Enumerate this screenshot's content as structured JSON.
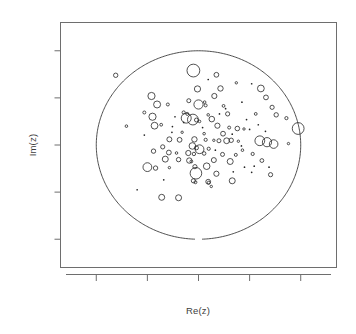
{
  "figure": {
    "width": 356,
    "height": 334,
    "background": "#ffffff",
    "line_color": "#6e6e6e",
    "point_color": "#262626",
    "circle_color": "#3a3a3a"
  },
  "labels": {
    "xlabel": "Re(z)",
    "ylabel": "Im(z)"
  },
  "chart_data": {
    "type": "scatter",
    "title": "",
    "xlabel": "Re(z)",
    "ylabel": "Im(z)",
    "grid": false,
    "legend": null,
    "xlim": [
      -1.35,
      1.35
    ],
    "ylim": [
      -1.3,
      1.3
    ],
    "x_ticks": [
      -1.0,
      -0.5,
      0.0,
      0.5,
      1.0
    ],
    "y_ticks": [
      -1.0,
      -0.5,
      0.0,
      0.5,
      1.0
    ],
    "x_tick_labels": [
      "",
      "",
      "",
      "",
      ""
    ],
    "y_tick_labels": [
      "",
      "",
      "",
      "",
      ""
    ],
    "annotations": [
      {
        "kind": "unit-circle",
        "center": [
          0.0,
          0.0
        ],
        "radius": 1.0,
        "note": "reference circle |z| = 1, drawn with a small gap at the bottom"
      }
    ],
    "size_encoding": "marker radius encodes magnitude/weight of each complex value",
    "point_count": 118,
    "points": [
      {
        "x": -0.81,
        "y": 0.74,
        "r": 2.2
      },
      {
        "x": -0.05,
        "y": 0.79,
        "r": 6.4
      },
      {
        "x": 0.175,
        "y": 0.745,
        "r": 2.4
      },
      {
        "x": 0.095,
        "y": 0.695,
        "r": 1.1
      },
      {
        "x": 0.37,
        "y": 0.66,
        "r": 1.2
      },
      {
        "x": 0.52,
        "y": 0.65,
        "r": 1.1
      },
      {
        "x": -0.01,
        "y": 0.595,
        "r": 3.1
      },
      {
        "x": 0.215,
        "y": 0.6,
        "r": 2.7
      },
      {
        "x": 0.61,
        "y": 0.6,
        "r": 3.4
      },
      {
        "x": -0.46,
        "y": 0.52,
        "r": 3.6
      },
      {
        "x": 0.155,
        "y": 0.52,
        "r": 2.6
      },
      {
        "x": 0.66,
        "y": 0.505,
        "r": 2.4
      },
      {
        "x": -0.095,
        "y": 0.47,
        "r": 2.0
      },
      {
        "x": 0.06,
        "y": 0.455,
        "r": 1.3
      },
      {
        "x": 0.425,
        "y": 0.455,
        "r": 1.1
      },
      {
        "x": -0.405,
        "y": 0.43,
        "r": 3.5
      },
      {
        "x": -0.3,
        "y": 0.43,
        "r": 1.5
      },
      {
        "x": 0.0,
        "y": 0.43,
        "r": 4.6
      },
      {
        "x": 0.07,
        "y": 0.42,
        "r": 1.5
      },
      {
        "x": 0.245,
        "y": 0.415,
        "r": 1.4
      },
      {
        "x": 0.72,
        "y": 0.4,
        "r": 2.1
      },
      {
        "x": -0.53,
        "y": 0.345,
        "r": 1.5
      },
      {
        "x": -0.145,
        "y": 0.345,
        "r": 1.6
      },
      {
        "x": -0.11,
        "y": 0.33,
        "r": 1.5
      },
      {
        "x": 0.095,
        "y": 0.32,
        "r": 1.3
      },
      {
        "x": 0.285,
        "y": 0.33,
        "r": 2.1
      },
      {
        "x": 0.56,
        "y": 0.33,
        "r": 1.4
      },
      {
        "x": 0.76,
        "y": 0.32,
        "r": 2.2
      },
      {
        "x": -0.45,
        "y": 0.3,
        "r": 3.6
      },
      {
        "x": -0.12,
        "y": 0.285,
        "r": 5.0
      },
      {
        "x": -0.055,
        "y": 0.27,
        "r": 5.4
      },
      {
        "x": -0.02,
        "y": 0.265,
        "r": 2.0
      },
      {
        "x": 0.01,
        "y": 0.25,
        "r": 1.3
      },
      {
        "x": 0.13,
        "y": 0.275,
        "r": 2.8
      },
      {
        "x": 0.86,
        "y": 0.285,
        "r": 1.6
      },
      {
        "x": -0.705,
        "y": 0.2,
        "r": 1.3
      },
      {
        "x": -0.43,
        "y": 0.205,
        "r": 3.4
      },
      {
        "x": -0.365,
        "y": 0.215,
        "r": 1.4
      },
      {
        "x": -0.255,
        "y": 0.195,
        "r": 1.1
      },
      {
        "x": 0.185,
        "y": 0.205,
        "r": 2.6
      },
      {
        "x": 0.3,
        "y": 0.185,
        "r": 1.5
      },
      {
        "x": 0.38,
        "y": 0.175,
        "r": 2.3
      },
      {
        "x": 0.445,
        "y": 0.17,
        "r": 1.2
      },
      {
        "x": 0.5,
        "y": 0.165,
        "r": 1.1
      },
      {
        "x": 0.975,
        "y": 0.175,
        "r": 5.9
      },
      {
        "x": -0.16,
        "y": 0.135,
        "r": 1.2
      },
      {
        "x": 0.055,
        "y": 0.12,
        "r": 1.3
      },
      {
        "x": 0.24,
        "y": 0.12,
        "r": 2.4
      },
      {
        "x": 0.33,
        "y": 0.115,
        "r": 1.1
      },
      {
        "x": -0.285,
        "y": 0.06,
        "r": 2.5
      },
      {
        "x": -0.185,
        "y": 0.055,
        "r": 2.4
      },
      {
        "x": -0.04,
        "y": 0.06,
        "r": 2.7
      },
      {
        "x": 0.07,
        "y": 0.055,
        "r": 1.6
      },
      {
        "x": 0.15,
        "y": 0.05,
        "r": 1.2
      },
      {
        "x": 0.2,
        "y": 0.045,
        "r": 2.0
      },
      {
        "x": 0.275,
        "y": 0.045,
        "r": 2.9
      },
      {
        "x": 0.32,
        "y": 0.05,
        "r": 2.2
      },
      {
        "x": 0.39,
        "y": 0.04,
        "r": 1.2
      },
      {
        "x": 0.6,
        "y": 0.045,
        "r": 4.9
      },
      {
        "x": 0.67,
        "y": 0.03,
        "r": 4.6
      },
      {
        "x": 0.735,
        "y": 0.01,
        "r": 4.3
      },
      {
        "x": 0.88,
        "y": 0.015,
        "r": 1.2
      },
      {
        "x": -0.35,
        "y": -0.02,
        "r": 2.1
      },
      {
        "x": -0.06,
        "y": -0.01,
        "r": 3.3
      },
      {
        "x": -0.02,
        "y": -0.03,
        "r": 2.0
      },
      {
        "x": 0.01,
        "y": -0.045,
        "r": 4.4
      },
      {
        "x": 0.1,
        "y": -0.04,
        "r": 1.6
      },
      {
        "x": 0.43,
        "y": -0.055,
        "r": 1.3
      },
      {
        "x": -0.44,
        "y": -0.065,
        "r": 2.2
      },
      {
        "x": -0.29,
        "y": -0.08,
        "r": 2.4
      },
      {
        "x": -0.215,
        "y": -0.085,
        "r": 1.3
      },
      {
        "x": -0.1,
        "y": -0.085,
        "r": 2.6
      },
      {
        "x": -0.045,
        "y": -0.095,
        "r": 1.7
      },
      {
        "x": 0.055,
        "y": -0.09,
        "r": 1.8
      },
      {
        "x": 0.235,
        "y": -0.1,
        "r": 2.0
      },
      {
        "x": 0.365,
        "y": -0.105,
        "r": 1.5
      },
      {
        "x": 0.53,
        "y": -0.095,
        "r": 1.6
      },
      {
        "x": -0.325,
        "y": -0.15,
        "r": 3.0
      },
      {
        "x": -0.195,
        "y": -0.155,
        "r": 2.2
      },
      {
        "x": -0.09,
        "y": -0.165,
        "r": 2.7
      },
      {
        "x": -0.07,
        "y": -0.175,
        "r": 1.4
      },
      {
        "x": 0.15,
        "y": -0.16,
        "r": 2.5
      },
      {
        "x": 0.31,
        "y": -0.175,
        "r": 3.0
      },
      {
        "x": 0.62,
        "y": -0.165,
        "r": 1.9
      },
      {
        "x": -0.5,
        "y": -0.235,
        "r": 4.4
      },
      {
        "x": -0.42,
        "y": -0.245,
        "r": 2.2
      },
      {
        "x": -0.285,
        "y": -0.24,
        "r": 1.2
      },
      {
        "x": -0.035,
        "y": -0.23,
        "r": 2.1
      },
      {
        "x": 0.08,
        "y": -0.225,
        "r": 3.3
      },
      {
        "x": 0.45,
        "y": -0.235,
        "r": 1.1
      },
      {
        "x": 0.545,
        "y": -0.225,
        "r": 1.0
      },
      {
        "x": 0.69,
        "y": -0.235,
        "r": 1.0
      },
      {
        "x": -0.025,
        "y": -0.3,
        "r": 5.8
      },
      {
        "x": 0.175,
        "y": -0.305,
        "r": 2.6
      },
      {
        "x": 0.705,
        "y": -0.315,
        "r": 2.1
      },
      {
        "x": -0.34,
        "y": -0.37,
        "r": 1.1
      },
      {
        "x": -0.05,
        "y": -0.38,
        "r": 2.1
      },
      {
        "x": -0.03,
        "y": -0.395,
        "r": 1.5
      },
      {
        "x": 0.095,
        "y": -0.39,
        "r": 2.4
      },
      {
        "x": 0.1,
        "y": -0.4,
        "r": 1.5
      },
      {
        "x": 0.33,
        "y": -0.38,
        "r": 3.0
      },
      {
        "x": 0.125,
        "y": -0.44,
        "r": 1.2
      },
      {
        "x": -0.6,
        "y": -0.475,
        "r": 1.1
      },
      {
        "x": -0.36,
        "y": -0.555,
        "r": 3.0
      },
      {
        "x": -0.195,
        "y": -0.56,
        "r": 3.0
      },
      {
        "x": 0.265,
        "y": 0.385,
        "r": 1.0
      },
      {
        "x": -0.53,
        "y": 0.105,
        "r": 1.0
      },
      {
        "x": 0.47,
        "y": 0.27,
        "r": 1.0
      },
      {
        "x": 0.585,
        "y": 0.215,
        "r": 1.0
      },
      {
        "x": -0.23,
        "y": 0.3,
        "r": 1.0
      },
      {
        "x": 0.04,
        "y": 0.185,
        "r": 1.0
      },
      {
        "x": 0.42,
        "y": -0.01,
        "r": 1.0
      },
      {
        "x": 0.52,
        "y": -0.29,
        "r": 1.0
      },
      {
        "x": 0.34,
        "y": -0.285,
        "r": 1.0
      },
      {
        "x": -0.145,
        "y": 0.24,
        "r": 1.0
      },
      {
        "x": 0.205,
        "y": 0.33,
        "r": 1.0
      },
      {
        "x": -0.26,
        "y": 0.135,
        "r": 1.0
      },
      {
        "x": 0.165,
        "y": -0.055,
        "r": 1.0
      },
      {
        "x": 0.655,
        "y": 0.145,
        "r": 1.0
      }
    ]
  }
}
